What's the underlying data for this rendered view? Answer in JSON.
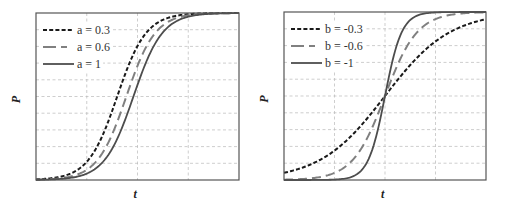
{
  "chart_data": [
    {
      "type": "line",
      "title": "",
      "xlabel": "t",
      "ylabel": "P",
      "xlim": [
        0,
        1
      ],
      "ylim": [
        0,
        1
      ],
      "grid": true,
      "grid_x": [
        0.25,
        0.5,
        0.75
      ],
      "grid_y": [
        0.1,
        0.2,
        0.3,
        0.4,
        0.5,
        0.6,
        0.7,
        0.8,
        0.9
      ],
      "tick_labels_shown": false,
      "legend_position": "upper left",
      "series": [
        {
          "name": "a = 0.3",
          "style": "short-dash",
          "color": "#1a1a1a",
          "center": 0.4,
          "steepness": 14
        },
        {
          "name": "a = 0.6",
          "style": "long-dash",
          "color": "#808080",
          "center": 0.445,
          "steepness": 14
        },
        {
          "name": "a = 1",
          "style": "solid",
          "color": "#4d4d4d",
          "center": 0.48,
          "steepness": 14
        }
      ]
    },
    {
      "type": "line",
      "title": "",
      "xlabel": "t",
      "ylabel": "P",
      "xlim": [
        0,
        1
      ],
      "ylim": [
        0,
        1
      ],
      "grid": true,
      "grid_x": [
        0.25,
        0.5,
        0.75
      ],
      "grid_y": [
        0.1,
        0.2,
        0.3,
        0.4,
        0.5,
        0.6,
        0.7,
        0.8,
        0.9
      ],
      "tick_labels_shown": false,
      "legend_position": "upper left",
      "series": [
        {
          "name": "b = -0.3",
          "style": "short-dash",
          "color": "#1a1a1a",
          "center": 0.5,
          "steepness": 6.2
        },
        {
          "name": "b = -0.6",
          "style": "long-dash",
          "color": "#808080",
          "center": 0.5,
          "steepness": 12.5
        },
        {
          "name": "b = -1",
          "style": "solid",
          "color": "#4d4d4d",
          "center": 0.5,
          "steepness": 24
        }
      ]
    }
  ],
  "panels": [
    {
      "xlabel": "t",
      "ylabel": "P",
      "legend": [
        "a = 0.3",
        "a = 0.6",
        "a = 1"
      ]
    },
    {
      "xlabel": "t",
      "ylabel": "P",
      "legend": [
        "b = -0.3",
        "b = -0.6",
        "b = -1"
      ]
    }
  ]
}
